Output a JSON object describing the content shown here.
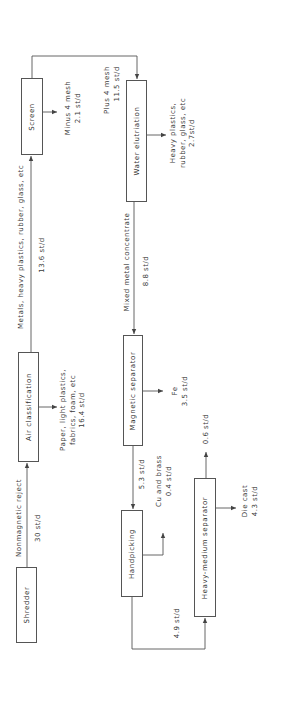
{
  "diagram": {
    "nodes": {
      "shredder": "Shredder",
      "air_classification": "Air classification",
      "screen": "Screen",
      "water_elutriation": "Water elutriation",
      "magnetic_separator": "Magnetic separator",
      "handpicking": "Handpicking",
      "heavy_medium_separator": "Heavy-medium separator"
    },
    "flows": {
      "shredder_to_air": {
        "from": "Shredder",
        "to": "Air classification",
        "label_lines": [
          "Nonmagnetic reject"
        ],
        "rate": "30 st/d"
      },
      "air_to_light_reject": {
        "from": "Air classification",
        "to": "output",
        "label_lines": [
          "Paper, light plastics,",
          "fabrics, foam, etc"
        ],
        "rate": "16.4 st/d"
      },
      "air_to_screen": {
        "from": "Air classification",
        "to": "Screen",
        "label_lines": [
          "Metals, heavy plastics, rubber, glass, etc"
        ],
        "rate": "13.6 st/d"
      },
      "screen_to_fines": {
        "from": "Screen",
        "to": "output",
        "label_lines": [
          "Minus 4 mesh"
        ],
        "rate": "2.1 st/d"
      },
      "screen_to_water": {
        "from": "Screen",
        "to": "Water elutriation",
        "label_lines": [
          "Plus 4 mesh"
        ],
        "rate": "11.5 st/d"
      },
      "water_to_heavy_reject": {
        "from": "Water elutriation",
        "to": "output",
        "label_lines": [
          "Heavy plastics,",
          "rubber, glass, etc"
        ],
        "rate": "2.7st/d"
      },
      "water_to_magnetic": {
        "from": "Water elutriation",
        "to": "Magnetic separator",
        "label_lines": [
          "Mixed metal concentrate"
        ],
        "rate": "8.8 st/d"
      },
      "magnetic_to_fe": {
        "from": "Magnetic separator",
        "to": "output",
        "label_lines": [
          "Fe"
        ],
        "rate": "3.5 st/d"
      },
      "magnetic_to_handpicking": {
        "from": "Magnetic separator",
        "to": "Handpicking",
        "label_lines": [],
        "rate": "5.3 st/d"
      },
      "handpicking_to_cu": {
        "from": "Handpicking",
        "to": "output",
        "label_lines": [
          "Cu and brass"
        ],
        "rate": "0.4 st/d"
      },
      "handpicking_to_hm": {
        "from": "Handpicking",
        "to": "Heavy-medium separator",
        "label_lines": [],
        "rate": "4.9 st/d"
      },
      "hm_to_die_cast": {
        "from": "Heavy-medium separator",
        "to": "output",
        "label_lines": [
          "Die cast"
        ],
        "rate": "4.3 st/d"
      },
      "hm_to_residue": {
        "from": "Heavy-medium separator",
        "to": "output",
        "label_lines": [],
        "rate": "0.6 st/d"
      }
    },
    "colors": {
      "line": "#555555",
      "text": "#3a3a3a",
      "background": "#ffffff"
    }
  }
}
